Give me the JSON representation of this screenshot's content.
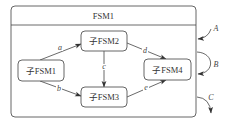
{
  "diagram": {
    "type": "hierarchical-state-machine",
    "parent": {
      "title": "FSM1"
    },
    "states": [
      {
        "id": "s1",
        "label": "子FSM1"
      },
      {
        "id": "s2",
        "label": "子FSM2"
      },
      {
        "id": "s3",
        "label": "子FSM3"
      },
      {
        "id": "s4",
        "label": "子FSM4"
      }
    ],
    "internal_transitions": [
      {
        "from": "子FSM1",
        "to": "子FSM2",
        "label": "a"
      },
      {
        "from": "子FSM1",
        "to": "子FSM3",
        "label": "b"
      },
      {
        "from": "子FSM2",
        "to": "子FSM3",
        "label": "c"
      },
      {
        "from": "子FSM2",
        "to": "子FSM4",
        "label": "d"
      },
      {
        "from": "子FSM3",
        "to": "子FSM4",
        "label": "e"
      }
    ],
    "external_transitions": [
      {
        "label": "A",
        "kind": "entry"
      },
      {
        "label": "B",
        "kind": "self-loop"
      },
      {
        "label": "C",
        "kind": "exit"
      }
    ]
  }
}
